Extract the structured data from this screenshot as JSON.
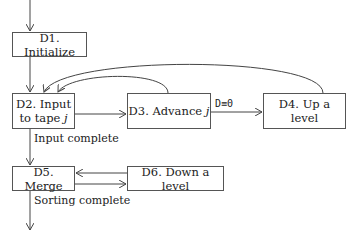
{
  "diagram": {
    "type": "flowchart",
    "nodes": [
      {
        "id": "D1",
        "label": "D1. Initialize"
      },
      {
        "id": "D2",
        "label_line1": "D2. Input",
        "label_line2": "to tape",
        "label_var": "j"
      },
      {
        "id": "D3",
        "label": "D3. Advance",
        "label_var": "j"
      },
      {
        "id": "D4",
        "label": "D4. Up a level"
      },
      {
        "id": "D5",
        "label": "D5. Merge"
      },
      {
        "id": "D6",
        "label": "D6. Down a level"
      }
    ],
    "edge_labels": {
      "d2_to_d5": "Input complete",
      "d3_to_d4": "D≡0",
      "d5_exit": "Sorting complete"
    },
    "edges": [
      {
        "from": "start",
        "to": "D1"
      },
      {
        "from": "D1",
        "to": "D2"
      },
      {
        "from": "D2",
        "to": "D3"
      },
      {
        "from": "D3",
        "to": "D4",
        "label": "D≡0"
      },
      {
        "from": "D3",
        "to": "D2"
      },
      {
        "from": "D4",
        "to": "D2"
      },
      {
        "from": "D2",
        "to": "D5",
        "label": "Input complete"
      },
      {
        "from": "D5",
        "to": "D6"
      },
      {
        "from": "D6",
        "to": "D5"
      },
      {
        "from": "D5",
        "to": "end",
        "label": "Sorting complete"
      }
    ]
  }
}
